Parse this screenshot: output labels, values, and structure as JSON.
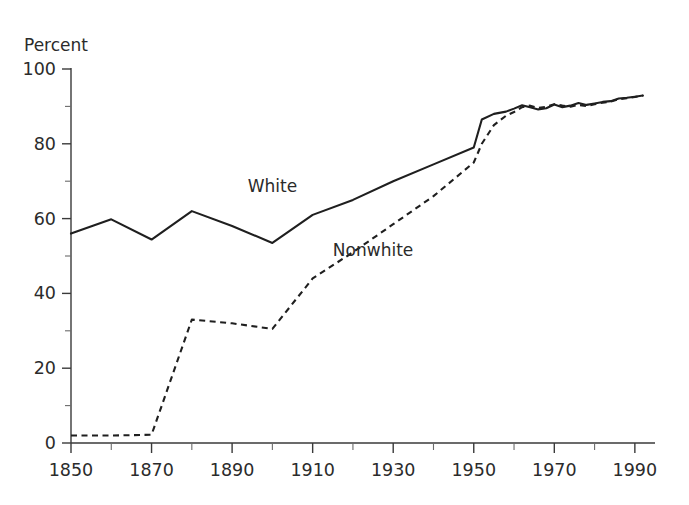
{
  "chart_data": {
    "type": "line",
    "title": "",
    "subtitle": "",
    "ylabel": "Percent",
    "xlabel": "",
    "xlim": [
      1850,
      1995
    ],
    "ylim": [
      0,
      100
    ],
    "grid": false,
    "legend_position": "inline-annotation",
    "y_ticks_major": [
      0,
      20,
      40,
      60,
      80,
      100
    ],
    "y_ticks_minor": [
      10,
      30,
      50,
      70,
      90
    ],
    "y_tick_labels": [
      "0",
      "20",
      "40",
      "60",
      "80",
      "100"
    ],
    "x_ticks_major": [
      1850,
      1870,
      1890,
      1910,
      1930,
      1950,
      1970,
      1990
    ],
    "x_ticks_minor": [
      1860,
      1880,
      1900,
      1920,
      1940,
      1960,
      1980
    ],
    "x_tick_labels": [
      "1850",
      "1870",
      "1890",
      "1910",
      "1930",
      "1950",
      "1970",
      "1990"
    ],
    "annotations": [
      {
        "text": "White",
        "x": 1900,
        "y": 67
      },
      {
        "text": "Nonwhite",
        "x": 1925,
        "y": 50
      }
    ],
    "series": [
      {
        "name": "White",
        "style": "solid",
        "x": [
          1850,
          1860,
          1870,
          1880,
          1890,
          1900,
          1910,
          1920,
          1930,
          1940,
          1950,
          1952,
          1955,
          1958,
          1960,
          1962,
          1964,
          1966,
          1968,
          1970,
          1972,
          1974,
          1976,
          1978,
          1980,
          1982,
          1984,
          1986,
          1988,
          1990,
          1992
        ],
        "values": [
          56,
          59.8,
          54.4,
          62,
          58,
          53.5,
          61,
          65,
          70,
          74.5,
          79,
          86.5,
          88,
          88.6,
          89.4,
          90.3,
          89.8,
          89.2,
          89.5,
          90.5,
          89.8,
          90.2,
          90.9,
          90.4,
          90.8,
          91.2,
          91.4,
          92.1,
          92.3,
          92.6,
          92.9
        ]
      },
      {
        "name": "Nonwhite",
        "style": "dashed",
        "x": [
          1850,
          1860,
          1870,
          1880,
          1890,
          1900,
          1910,
          1920,
          1930,
          1940,
          1950,
          1952,
          1955,
          1958,
          1960,
          1962,
          1964,
          1966,
          1968,
          1970,
          1972,
          1974,
          1976,
          1978,
          1980,
          1982,
          1984,
          1986,
          1988,
          1990,
          1992
        ],
        "values": [
          2,
          2,
          2.2,
          33,
          32,
          30.5,
          44,
          51,
          58.5,
          66,
          75,
          80,
          85,
          87.5,
          88.5,
          89.8,
          90.2,
          89.6,
          89.9,
          90.6,
          90.2,
          89.9,
          90.4,
          90.1,
          90.6,
          91,
          91.3,
          91.9,
          92.2,
          92.5,
          92.9
        ]
      }
    ]
  },
  "colors": {
    "background": "#ffffff",
    "axis": "#3a3a3a",
    "text": "#2b2b2b",
    "series_white": "#1f1f1f",
    "series_nonwhite": "#1f1f1f"
  }
}
